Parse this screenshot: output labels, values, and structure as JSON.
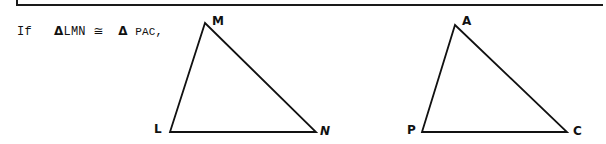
{
  "statement": {
    "prefix": "If",
    "triangle1_symbol": "Δ",
    "triangle1_name": "LMN",
    "relation": "≅",
    "triangle2_symbol": "Δ",
    "triangle2_name": "PAC",
    "suffix": ","
  },
  "triangles": [
    {
      "name": "LMN",
      "vertices": [
        {
          "label": "L",
          "x": 170,
          "y": 132
        },
        {
          "label": "M",
          "x": 205,
          "y": 23
        },
        {
          "label": "N",
          "x": 316,
          "y": 132
        }
      ]
    },
    {
      "name": "PAC",
      "vertices": [
        {
          "label": "P",
          "x": 422,
          "y": 132
        },
        {
          "label": "A",
          "x": 455,
          "y": 25
        },
        {
          "label": "C",
          "x": 567,
          "y": 132
        }
      ]
    }
  ],
  "labels": {
    "L": "L",
    "M": "M",
    "N": "N",
    "P": "P",
    "A": "A",
    "C": "C"
  }
}
